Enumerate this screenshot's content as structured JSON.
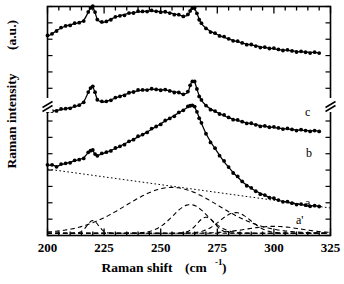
{
  "figure": {
    "kind": "raman-spectra-plot",
    "background": "#ffffff",
    "ink": "#000000"
  },
  "axes": {
    "x_label_main": "Raman shift",
    "x_label_unit_open": "(cm",
    "x_label_unit_exp": "-1",
    "x_label_unit_close": ")",
    "y_label_main": "Raman intensity",
    "y_label_unit": "(a.u.)",
    "x_ticklabels": [
      "200",
      "225",
      "250",
      "275",
      "300",
      "325"
    ],
    "y_ticklabels": [],
    "y_axis_break": true,
    "frame": true
  },
  "annotations": [
    {
      "id": "label-c",
      "text": "c"
    },
    {
      "id": "label-b",
      "text": "b"
    },
    {
      "id": "label-a",
      "text": "a"
    },
    {
      "id": "label-a-prime",
      "text": "a'"
    }
  ],
  "chart_data": {
    "type": "line",
    "title": "",
    "xlabel": "Raman shift (cm-1)",
    "ylabel": "Raman intensity (a.u.)",
    "xlim": [
      200,
      325
    ],
    "ylim": [
      0,
      100
    ],
    "grid": false,
    "legend": "none (curves labelled a, a', b, c at right)",
    "marker": "filled-circle",
    "series": [
      {
        "name": "c",
        "label": "c",
        "style": "markers+fit-line",
        "offset_units": 70,
        "x": [
          200,
          202,
          204,
          206,
          208,
          210,
          212,
          214,
          216,
          218,
          219,
          220,
          221,
          222,
          224,
          226,
          228,
          230,
          232,
          234,
          236,
          238,
          240,
          242,
          244,
          246,
          248,
          250,
          252,
          254,
          256,
          258,
          260,
          262,
          263,
          264,
          265,
          266,
          267,
          268,
          270,
          272,
          274,
          276,
          278,
          280,
          282,
          284,
          286,
          288,
          290,
          292,
          294,
          296,
          298,
          300,
          302,
          304,
          306,
          308,
          310,
          312,
          314,
          316,
          318,
          320
        ],
        "y": [
          17.0,
          18.0,
          19.5,
          20.5,
          21.5,
          22.0,
          22.5,
          23.0,
          24.0,
          27.5,
          29.5,
          29.8,
          27.5,
          24.5,
          23.0,
          23.5,
          24.5,
          25.3,
          26.0,
          26.5,
          27.0,
          27.3,
          27.6,
          27.8,
          28.0,
          28.0,
          27.9,
          27.8,
          27.5,
          27.2,
          26.8,
          26.3,
          25.8,
          26.2,
          28.0,
          29.5,
          29.2,
          27.0,
          24.5,
          22.5,
          20.5,
          19.2,
          18.2,
          17.3,
          16.5,
          15.8,
          15.2,
          14.6,
          14.1,
          13.6,
          13.2,
          12.8,
          12.4,
          12.1,
          11.8,
          11.5,
          11.2,
          11.0,
          10.8,
          10.6,
          10.4,
          10.2,
          10.1,
          10.0,
          9.9,
          9.8
        ]
      },
      {
        "name": "b",
        "label": "b",
        "style": "markers+fit-line",
        "offset_units": 40,
        "x": [
          200,
          202,
          204,
          206,
          208,
          210,
          212,
          214,
          216,
          218,
          219,
          220,
          221,
          222,
          224,
          226,
          228,
          230,
          232,
          234,
          236,
          238,
          240,
          242,
          244,
          246,
          248,
          250,
          252,
          254,
          256,
          258,
          260,
          262,
          263,
          264,
          265,
          266,
          267,
          268,
          270,
          272,
          274,
          276,
          278,
          280,
          282,
          284,
          286,
          288,
          290,
          292,
          294,
          296,
          298,
          300,
          302,
          304,
          306,
          308,
          310,
          312,
          314,
          316,
          318,
          320
        ],
        "y": [
          14.0,
          14.3,
          14.6,
          15.0,
          15.4,
          15.8,
          16.3,
          17.0,
          18.5,
          22.5,
          24.5,
          24.8,
          22.5,
          19.5,
          18.3,
          18.6,
          19.3,
          20.0,
          20.8,
          21.5,
          22.2,
          22.8,
          23.2,
          23.5,
          23.7,
          23.8,
          23.8,
          23.7,
          23.5,
          23.2,
          22.8,
          22.3,
          21.8,
          22.5,
          25.5,
          27.5,
          27.0,
          24.0,
          21.0,
          19.0,
          16.8,
          15.3,
          14.2,
          13.2,
          12.3,
          11.5,
          10.8,
          10.2,
          9.7,
          9.2,
          8.8,
          8.4,
          8.0,
          7.7,
          7.4,
          7.1,
          6.9,
          6.7,
          6.5,
          6.3,
          6.1,
          6.0,
          5.9,
          5.8,
          5.7,
          5.6
        ]
      },
      {
        "name": "a",
        "label": "a",
        "style": "markers+fit-line",
        "offset_units": 0,
        "x": [
          200,
          202,
          204,
          206,
          208,
          210,
          212,
          214,
          216,
          218,
          219,
          220,
          221,
          222,
          224,
          226,
          228,
          230,
          232,
          234,
          236,
          238,
          240,
          242,
          244,
          246,
          248,
          250,
          252,
          254,
          256,
          258,
          260,
          262,
          263,
          264,
          265,
          266,
          267,
          268,
          270,
          272,
          274,
          276,
          278,
          280,
          282,
          284,
          286,
          288,
          290,
          292,
          294,
          296,
          298,
          300,
          302,
          304,
          306,
          308,
          310,
          312,
          314,
          316,
          318,
          320
        ],
        "y": [
          30.5,
          30.8,
          30.2,
          30.9,
          31.5,
          32.0,
          32.6,
          33.2,
          34.0,
          36.2,
          37.2,
          37.0,
          35.5,
          35.0,
          35.6,
          36.4,
          37.2,
          38.0,
          39.0,
          40.0,
          41.0,
          42.0,
          43.0,
          44.0,
          45.2,
          46.4,
          47.6,
          48.8,
          50.0,
          51.2,
          52.4,
          53.6,
          54.8,
          56.0,
          56.6,
          57.0,
          56.0,
          54.0,
          51.5,
          49.0,
          44.5,
          41.0,
          38.0,
          35.0,
          32.2,
          29.8,
          27.5,
          25.5,
          23.6,
          22.0,
          20.6,
          19.4,
          18.4,
          17.5,
          16.7,
          16.0,
          15.4,
          14.9,
          14.5,
          14.1,
          13.8,
          13.5,
          13.3,
          13.1,
          12.9,
          12.8
        ]
      }
    ],
    "baseline": {
      "name": "background-baseline",
      "style": "dotted",
      "x": [
        200,
        325
      ],
      "y": [
        29.0,
        12.0
      ]
    },
    "components": [
      {
        "name": "component-220",
        "style": "dashed",
        "center": 220,
        "fwhm": 6,
        "amplitude": 5.5
      },
      {
        "name": "component-255",
        "style": "dashed",
        "center": 255,
        "fwhm": 48,
        "amplitude": 20.0
      },
      {
        "name": "component-263",
        "style": "dashed",
        "center": 263,
        "fwhm": 18,
        "amplitude": 12.5
      },
      {
        "name": "component-270",
        "style": "dashed",
        "center": 270,
        "fwhm": 9,
        "amplitude": 7.0
      },
      {
        "name": "component-283",
        "style": "dashed",
        "center": 283,
        "fwhm": 16,
        "amplitude": 9.0
      },
      {
        "name": "component-300",
        "style": "dashed",
        "center": 300,
        "fwhm": 28,
        "amplitude": 3.0
      }
    ]
  }
}
